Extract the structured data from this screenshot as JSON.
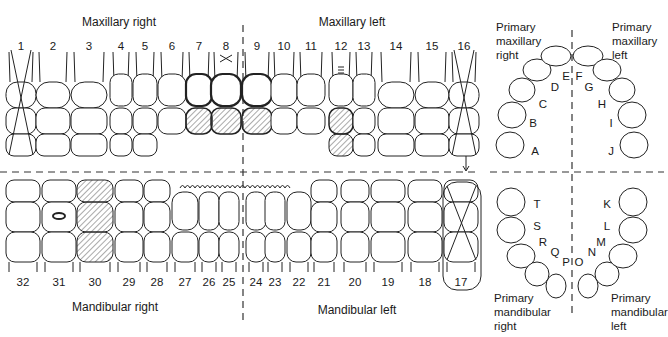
{
  "title_fragment": "…ng … p…",
  "quadrants": {
    "maxillary_right": "Maxillary right",
    "maxillary_left": "Maxillary left",
    "mandibular_right": "Mandibular right",
    "mandibular_left": "Mandibular left"
  },
  "upper_numbers": [
    {
      "n": "1",
      "x": 21
    },
    {
      "n": "2",
      "x": 53
    },
    {
      "n": "3",
      "x": 89
    },
    {
      "n": "4",
      "x": 121
    },
    {
      "n": "5",
      "x": 145
    },
    {
      "n": "6",
      "x": 172
    },
    {
      "n": "7",
      "x": 199
    },
    {
      "n": "8",
      "x": 226
    },
    {
      "n": "9",
      "x": 257
    },
    {
      "n": "10",
      "x": 284
    },
    {
      "n": "11",
      "x": 311
    },
    {
      "n": "12",
      "x": 341
    },
    {
      "n": "13",
      "x": 364
    },
    {
      "n": "14",
      "x": 396
    },
    {
      "n": "15",
      "x": 432
    },
    {
      "n": "16",
      "x": 464
    }
  ],
  "lower_numbers": [
    {
      "n": "32",
      "x": 23
    },
    {
      "n": "31",
      "x": 59
    },
    {
      "n": "30",
      "x": 95
    },
    {
      "n": "29",
      "x": 129
    },
    {
      "n": "28",
      "x": 157
    },
    {
      "n": "27",
      "x": 185
    },
    {
      "n": "26",
      "x": 209
    },
    {
      "n": "25",
      "x": 229
    },
    {
      "n": "24",
      "x": 256
    },
    {
      "n": "23",
      "x": 275
    },
    {
      "n": "22",
      "x": 299
    },
    {
      "n": "21",
      "x": 324
    },
    {
      "n": "20",
      "x": 355
    },
    {
      "n": "19",
      "x": 388
    },
    {
      "n": "18",
      "x": 425
    },
    {
      "n": "17",
      "x": 461
    }
  ],
  "primary": {
    "maxillary_right_label": [
      "Primary",
      "maxillary",
      "right"
    ],
    "maxillary_left_label": [
      "Primary",
      "maxillary",
      "left"
    ],
    "mandibular_right_label": [
      "Primary",
      "mandibular",
      "right"
    ],
    "mandibular_left_label": [
      "Primary",
      "mandibular",
      "left"
    ],
    "upper_letters": [
      {
        "l": "A",
        "x": 535,
        "y": 151
      },
      {
        "l": "B",
        "x": 533,
        "y": 123
      },
      {
        "l": "C",
        "x": 543,
        "y": 104
      },
      {
        "l": "D",
        "x": 555,
        "y": 87
      },
      {
        "l": "E",
        "x": 566,
        "y": 76
      },
      {
        "l": "F",
        "x": 579,
        "y": 76
      },
      {
        "l": "G",
        "x": 589,
        "y": 87
      },
      {
        "l": "H",
        "x": 602,
        "y": 104
      },
      {
        "l": "I",
        "x": 611,
        "y": 123
      },
      {
        "l": "J",
        "x": 611,
        "y": 151
      }
    ],
    "lower_letters": [
      {
        "l": "T",
        "x": 537,
        "y": 204
      },
      {
        "l": "S",
        "x": 537,
        "y": 226
      },
      {
        "l": "R",
        "x": 543,
        "y": 242
      },
      {
        "l": "Q",
        "x": 555,
        "y": 252
      },
      {
        "l": "P",
        "x": 566,
        "y": 262
      },
      {
        "l": "O",
        "x": 579,
        "y": 262
      },
      {
        "l": "N",
        "x": 592,
        "y": 252
      },
      {
        "l": "M",
        "x": 601,
        "y": 242
      },
      {
        "l": "L",
        "x": 607,
        "y": 226
      },
      {
        "l": "K",
        "x": 607,
        "y": 204
      }
    ]
  },
  "markings": {
    "extracted_teeth": [
      "1",
      "16",
      "17"
    ],
    "restored_hatched": [
      "7",
      "8",
      "9",
      "12",
      "30"
    ],
    "crowns_outlined_bold": [
      "7",
      "8",
      "9"
    ],
    "x_above": "8",
    "lines_above": "12",
    "occlusal_amalgam": "31",
    "calculus_wave": "lower anterior 22-27",
    "arrow_from": "16"
  },
  "colors": {
    "line": "#1a1a1a",
    "hatch": "#555555",
    "background": "#ffffff"
  }
}
